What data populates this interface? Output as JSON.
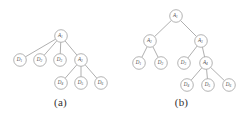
{
  "figure": {
    "panels": [
      {
        "id": "a",
        "caption": "(a)",
        "nodes": [
          {
            "id": "a1",
            "label": "A",
            "sub": "1",
            "kind": "attack",
            "x": 61,
            "y": 36
          },
          {
            "id": "d1",
            "label": "D",
            "sub": "1",
            "kind": "defense",
            "x": 20,
            "y": 60
          },
          {
            "id": "d2",
            "label": "D",
            "sub": "2",
            "kind": "defense",
            "x": 40,
            "y": 60
          },
          {
            "id": "d3",
            "label": "D",
            "sub": "3",
            "kind": "defense",
            "x": 60,
            "y": 60
          },
          {
            "id": "a2",
            "label": "A",
            "sub": "2",
            "kind": "attack",
            "x": 81,
            "y": 60
          },
          {
            "id": "d4",
            "label": "D",
            "sub": "4",
            "kind": "defense",
            "x": 61,
            "y": 83
          },
          {
            "id": "d5",
            "label": "D",
            "sub": "5",
            "kind": "defense",
            "x": 81,
            "y": 83
          },
          {
            "id": "d6",
            "label": "D",
            "sub": "6",
            "kind": "defense",
            "x": 101,
            "y": 83
          }
        ],
        "edges": [
          {
            "from": "a1",
            "to": "d1"
          },
          {
            "from": "a1",
            "to": "d2"
          },
          {
            "from": "a1",
            "to": "d3"
          },
          {
            "from": "a1",
            "to": "a2"
          },
          {
            "from": "a2",
            "to": "d4"
          },
          {
            "from": "a2",
            "to": "d5"
          },
          {
            "from": "a2",
            "to": "d6"
          }
        ]
      },
      {
        "id": "b",
        "caption": "(b)",
        "nodes": [
          {
            "id": "a1",
            "label": "A",
            "sub": "1",
            "kind": "attack",
            "x": 55,
            "y": 16
          },
          {
            "id": "a2",
            "label": "A",
            "sub": "2",
            "kind": "attack",
            "x": 29,
            "y": 41
          },
          {
            "id": "a3",
            "label": "A",
            "sub": "3",
            "kind": "attack",
            "x": 80,
            "y": 41
          },
          {
            "id": "d1",
            "label": "D",
            "sub": "1",
            "kind": "defense",
            "x": 18,
            "y": 63
          },
          {
            "id": "d2",
            "label": "D",
            "sub": "2",
            "kind": "defense",
            "x": 40,
            "y": 63
          },
          {
            "id": "d3",
            "label": "D",
            "sub": "3",
            "kind": "defense",
            "x": 63,
            "y": 63
          },
          {
            "id": "a4",
            "label": "A",
            "sub": "4",
            "kind": "attack",
            "x": 85,
            "y": 63
          },
          {
            "id": "d4",
            "label": "D",
            "sub": "4",
            "kind": "defense",
            "x": 66,
            "y": 85
          },
          {
            "id": "d5",
            "label": "D",
            "sub": "5",
            "kind": "defense",
            "x": 87,
            "y": 85
          },
          {
            "id": "d6",
            "label": "D",
            "sub": "6",
            "kind": "defense",
            "x": 108,
            "y": 85
          }
        ],
        "edges": [
          {
            "from": "a1",
            "to": "a2"
          },
          {
            "from": "a1",
            "to": "a3"
          },
          {
            "from": "a2",
            "to": "d1"
          },
          {
            "from": "a2",
            "to": "d2"
          },
          {
            "from": "a3",
            "to": "d3"
          },
          {
            "from": "a3",
            "to": "a4"
          },
          {
            "from": "a4",
            "to": "d4"
          },
          {
            "from": "a4",
            "to": "d5"
          },
          {
            "from": "a4",
            "to": "d6"
          }
        ]
      }
    ],
    "style": {
      "node_radius": 6.3,
      "node_fill": "#ffffff",
      "node_stroke": "#9a9a9a",
      "edge_stroke": "#8d8d8d",
      "label_color": "#4a4a4a",
      "caption_color": "#33312f",
      "background": "#ffffff"
    }
  }
}
